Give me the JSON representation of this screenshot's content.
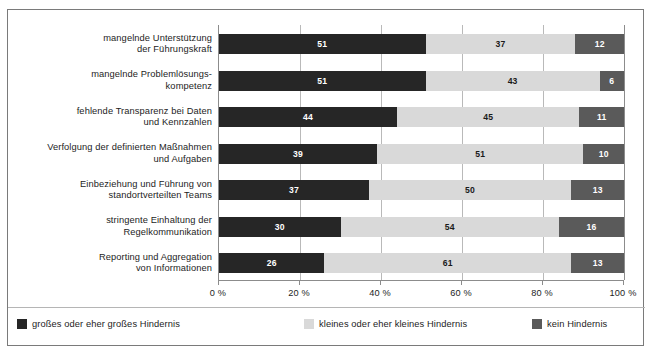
{
  "chart_data": {
    "type": "bar",
    "subtype": "horizontal-100-percent-stacked",
    "title": "",
    "xlabel": "",
    "ylabel": "",
    "xlim": [
      0,
      100
    ],
    "xticks": [
      0,
      20,
      40,
      60,
      80,
      100
    ],
    "xtick_labels": [
      "0 %",
      "20 %",
      "40 %",
      "60 %",
      "80 %",
      "100 %"
    ],
    "grid": true,
    "grid_axis": "x",
    "legend_position": "bottom",
    "categories": [
      "mangelnde Unterstützung\nder Führungskraft",
      "mangelnde Problemlösungs-\nkompetenz",
      "fehlende Transparenz bei Daten\nund Kennzahlen",
      "Verfolgung der definierten Maßnahmen\nund Aufgaben",
      "Einbeziehung und Führung von\nstandortverteilten Teams",
      "stringente Einhaltung der\nRegelkommunikation",
      "Reporting und Aggregation\nvon Informationen"
    ],
    "category_lines": [
      [
        "mangelnde Unterstützung",
        "der Führungskraft"
      ],
      [
        "mangelnde Problemlösungs-",
        "kompetenz"
      ],
      [
        "fehlende Transparenz bei Daten",
        "und Kennzahlen"
      ],
      [
        "Verfolgung der definierten Maßnahmen",
        "und Aufgaben"
      ],
      [
        "Einbeziehung und Führung von",
        "standortverteilten Teams"
      ],
      [
        "stringente Einhaltung der",
        "Regelkommunikation"
      ],
      [
        "Reporting und Aggregation",
        "von Informationen"
      ]
    ],
    "series": [
      {
        "name": "großes oder eher großes Hindernis",
        "color": "#262626",
        "values": [
          51,
          51,
          44,
          39,
          37,
          30,
          26
        ]
      },
      {
        "name": "kleines oder eher kleines Hindernis",
        "color": "#d9d9d9",
        "values": [
          37,
          43,
          45,
          51,
          50,
          54,
          61
        ]
      },
      {
        "name": "kein Hindernis",
        "color": "#5a5a5a",
        "values": [
          12,
          6,
          11,
          10,
          13,
          16,
          13
        ]
      }
    ]
  },
  "legend": {
    "items": [
      {
        "label": "großes oder eher großes Hindernis",
        "color": "#262626"
      },
      {
        "label": "kleines oder eher kleines Hindernis",
        "color": "#d9d9d9"
      },
      {
        "label": "kein Hindernis",
        "color": "#5a5a5a"
      }
    ]
  }
}
